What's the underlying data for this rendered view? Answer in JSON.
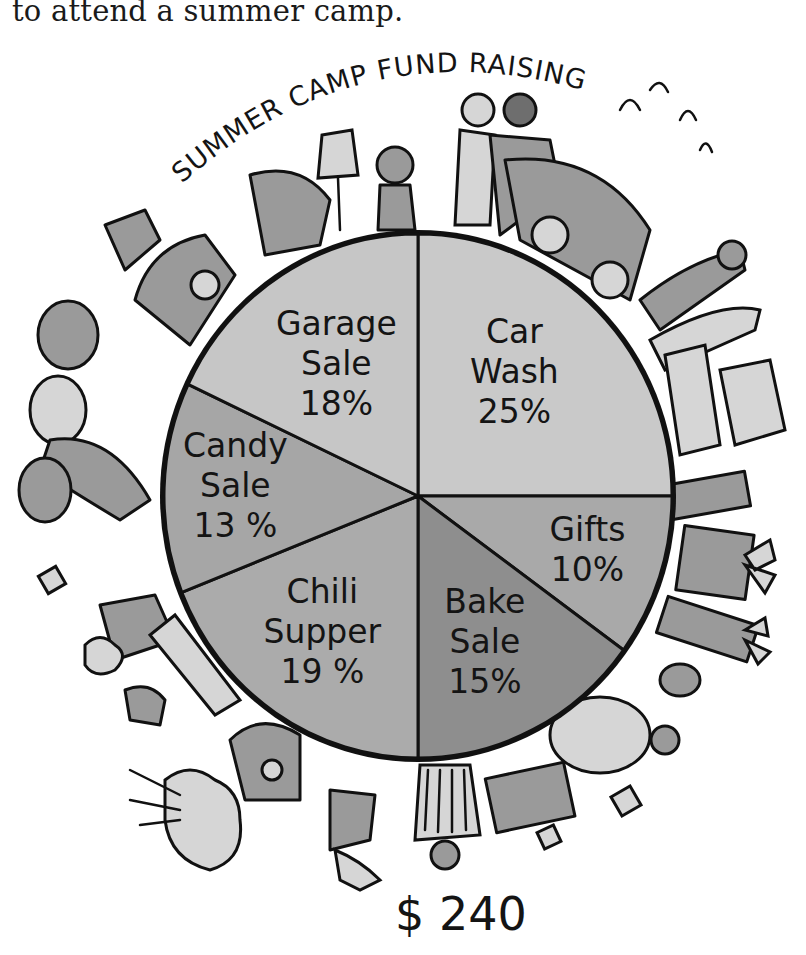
{
  "intro_text": "to attend a summer camp.",
  "chart_data": {
    "type": "pie",
    "title": "SUMMER CAMP FUND RAISING",
    "total_label": "$ 240",
    "total_value": 240,
    "start_angle_deg": -90,
    "direction": "clockwise",
    "slices": [
      {
        "label": "Car Wash",
        "label_lines": [
          "Car",
          "Wash"
        ],
        "value": 25,
        "percent_label": "25%",
        "fill": "#c9c9c9"
      },
      {
        "label": "Gifts",
        "label_lines": [
          "Gifts"
        ],
        "value": 10,
        "percent_label": "10%",
        "fill": "#a9a9a9"
      },
      {
        "label": "Bake Sale",
        "label_lines": [
          "Bake",
          "Sale"
        ],
        "value": 15,
        "percent_label": "15%",
        "fill": "#8e8e8e"
      },
      {
        "label": "Chili Supper",
        "label_lines": [
          "Chili",
          "Supper"
        ],
        "value": 19,
        "percent_label": "19 %",
        "fill": "#ababab"
      },
      {
        "label": "Candy Sale",
        "label_lines": [
          "Candy",
          "Sale"
        ],
        "value": 13,
        "percent_label": "13 %",
        "fill": "#a6a6a6"
      },
      {
        "label": "Garage Sale",
        "label_lines": [
          "Garage",
          "Sale"
        ],
        "value": 18,
        "percent_label": "18%",
        "fill": "#c6c6c6"
      }
    ],
    "decorations": [
      "garage-sale-items",
      "car-wash-scene",
      "gift-boxes",
      "baked-goods",
      "chili-supper",
      "candy"
    ]
  }
}
